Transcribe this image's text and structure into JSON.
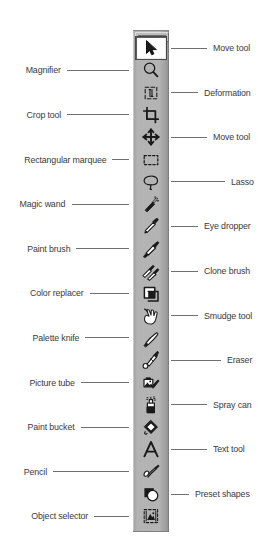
{
  "figure": {
    "palette_color": "#b0b0b0",
    "label_color": "#3b3b3b",
    "leader_color": "#6f6f6f",
    "selected_tool": "Move tool"
  },
  "tools": [
    {
      "icon": "arrow-cursor-icon",
      "label": "Move tool",
      "side": "right",
      "selected": true
    },
    {
      "icon": "magnifier-icon",
      "label": "Magnifier",
      "side": "left",
      "selected": false
    },
    {
      "icon": "deformation-icon",
      "label": "Deformation",
      "side": "right",
      "selected": false
    },
    {
      "icon": "crop-icon",
      "label": "Crop tool",
      "side": "left",
      "selected": false
    },
    {
      "icon": "four-way-arrows-icon",
      "label": "Move tool",
      "side": "right",
      "selected": false
    },
    {
      "icon": "rectangular-marquee-icon",
      "label": "Rectangular marquee",
      "side": "left",
      "selected": false
    },
    {
      "icon": "lasso-icon",
      "label": "Lasso",
      "side": "right",
      "selected": false
    },
    {
      "icon": "magic-wand-icon",
      "label": "Magic wand",
      "side": "left",
      "selected": false
    },
    {
      "icon": "eye-dropper-icon",
      "label": "Eye dropper",
      "side": "right",
      "selected": false
    },
    {
      "icon": "paint-brush-icon",
      "label": "Paint brush",
      "side": "left",
      "selected": false
    },
    {
      "icon": "clone-brush-icon",
      "label": "Clone brush",
      "side": "right",
      "selected": false
    },
    {
      "icon": "color-replacer-icon",
      "label": "Color replacer",
      "side": "left",
      "selected": false
    },
    {
      "icon": "smudge-hand-icon",
      "label": "Smudge tool",
      "side": "right",
      "selected": false
    },
    {
      "icon": "palette-knife-icon",
      "label": "Palette knife",
      "side": "left",
      "selected": false
    },
    {
      "icon": "eraser-icon",
      "label": "Eraser",
      "side": "right",
      "selected": false
    },
    {
      "icon": "picture-tube-icon",
      "label": "Picture tube",
      "side": "left",
      "selected": false
    },
    {
      "icon": "spray-can-icon",
      "label": "Spray can",
      "side": "right",
      "selected": false
    },
    {
      "icon": "paint-bucket-icon",
      "label": "Paint bucket",
      "side": "left",
      "selected": false
    },
    {
      "icon": "text-tool-icon",
      "label": "Text tool",
      "side": "right",
      "selected": false
    },
    {
      "icon": "pencil-icon",
      "label": "Pencil",
      "side": "left",
      "selected": false
    },
    {
      "icon": "preset-shapes-icon",
      "label": "Preset shapes",
      "side": "right",
      "selected": false
    },
    {
      "icon": "object-selector-icon",
      "label": "Object selector",
      "side": "left",
      "selected": false
    }
  ]
}
